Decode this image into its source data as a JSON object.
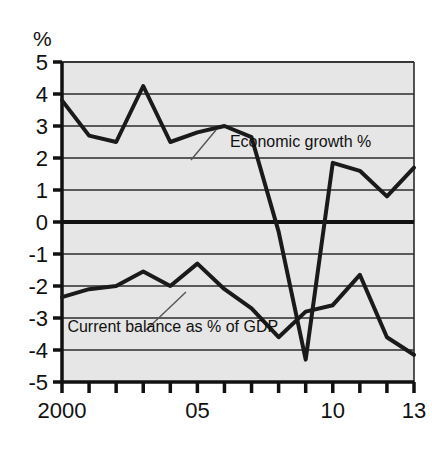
{
  "chart_data": {
    "type": "line",
    "title": "",
    "ylabel": "%",
    "xlabel": "",
    "ylim": [
      -5,
      5
    ],
    "xlim": [
      2000,
      2013
    ],
    "grid": true,
    "legend_position": "inline-annotations",
    "y_ticks": [
      "5",
      "4",
      "3",
      "2",
      "1",
      "0",
      "-1",
      "-2",
      "-3",
      "-4",
      "-5"
    ],
    "y_tick_values": [
      5,
      4,
      3,
      2,
      1,
      0,
      -1,
      -2,
      -3,
      -4,
      -5
    ],
    "x_ticks_labeled": [
      "2000",
      "05",
      "10",
      "13"
    ],
    "x_tick_values": [
      2000,
      2001,
      2002,
      2003,
      2004,
      2005,
      2006,
      2007,
      2008,
      2009,
      2010,
      2011,
      2012,
      2013
    ],
    "x": [
      2000,
      2001,
      2002,
      2003,
      2004,
      2005,
      2006,
      2007,
      2008,
      2009,
      2010,
      2011,
      2012,
      2013
    ],
    "series": [
      {
        "name": "Economic growth %",
        "values": [
          3.8,
          2.7,
          2.5,
          4.25,
          2.5,
          2.8,
          3.0,
          2.65,
          -0.3,
          -4.3,
          1.85,
          1.6,
          0.8,
          1.7
        ]
      },
      {
        "name": "Current balance as % of GDP",
        "values": [
          -2.35,
          -2.1,
          -2.0,
          -1.55,
          -2.0,
          -1.3,
          -2.1,
          -2.7,
          -3.6,
          -2.8,
          -2.6,
          -1.65,
          -3.6,
          -4.15
        ]
      }
    ],
    "annotations": [
      {
        "text": "Economic growth %",
        "x": 2006.2,
        "y": 2.35
      },
      {
        "text": "Current balance as % of GDP",
        "x": 2000.2,
        "y": -3.45
      }
    ]
  },
  "styling": {
    "plot_background": "#e6e6e6",
    "line_color": "#1a1a1a",
    "grid_color": "#2b2b2b",
    "axis_color": "#111111",
    "page_background": "#ffffff"
  }
}
